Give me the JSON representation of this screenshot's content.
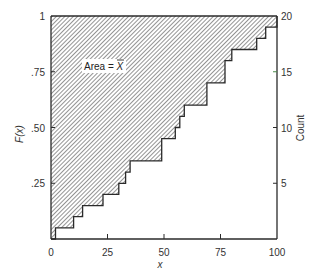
{
  "chart_data": {
    "type": "line",
    "subtype": "empirical-cdf-step",
    "title": "",
    "xlabel": "x",
    "ylabel_left": "F(x)",
    "ylabel_right": "Count",
    "xlim": [
      0,
      100
    ],
    "ylim_left": [
      0,
      1
    ],
    "ylim_right": [
      0,
      20
    ],
    "x_ticks": [
      "0",
      "25",
      "50",
      "75",
      "100"
    ],
    "x_tick_values": [
      0,
      25,
      50,
      75,
      100
    ],
    "y_left_ticks": [
      ".25",
      ".50",
      ".75",
      "1"
    ],
    "y_left_tick_values": [
      0.25,
      0.5,
      0.75,
      1.0
    ],
    "y_right_ticks": [
      "5",
      "10",
      "15",
      "20"
    ],
    "y_right_tick_values": [
      5,
      10,
      15,
      20
    ],
    "grid": false,
    "legend": null,
    "annotation": {
      "text": "Area = ",
      "symbol": "X",
      "overbar": true
    },
    "shaded_region": "above step function (hatched)",
    "steps": {
      "x": [
        2,
        10,
        14,
        23,
        30,
        33,
        35,
        49,
        55,
        57,
        59,
        69,
        77,
        80,
        91,
        95,
        100
      ],
      "count": [
        1,
        2,
        3,
        4,
        5,
        6,
        7,
        9,
        10,
        11,
        12,
        14,
        16,
        17,
        18,
        19,
        20
      ]
    },
    "observations": [
      2,
      10,
      14,
      23,
      30,
      33,
      35,
      49,
      49,
      55,
      57,
      59,
      69,
      69,
      77,
      77,
      80,
      91,
      95,
      100
    ]
  },
  "labels": {
    "x_axis": "x",
    "y_left": "F(x)",
    "y_right": "Count",
    "area_text": "Area = ",
    "area_symbol": "X",
    "x_ticks": [
      "0",
      "25",
      "50",
      "75",
      "100"
    ],
    "y_left_ticks": [
      ".25",
      ".50",
      ".75",
      "1"
    ],
    "y_right_ticks": [
      "5",
      "10",
      "15",
      "20"
    ]
  },
  "colors": {
    "line": "#2a2a2a",
    "hatch": "#3a3a3a",
    "background": "#ffffff",
    "tick_15": "#4a8a4a"
  }
}
